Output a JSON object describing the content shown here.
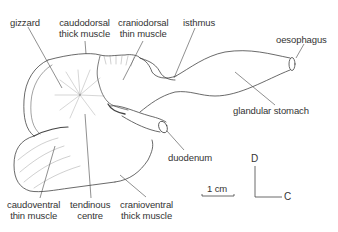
{
  "figure": {
    "labels": {
      "gizzard": {
        "line1": "gizzard"
      },
      "caudodorsal": {
        "line1": "caudodorsal",
        "line2": "thick muscle"
      },
      "craniodorsal": {
        "line1": "craniodorsal",
        "line2": "thin muscle"
      },
      "isthmus": {
        "line1": "isthmus"
      },
      "oesophagus": {
        "line1": "oesophagus"
      },
      "glandular": {
        "line1": "glandular stomach"
      },
      "duodenum": {
        "line1": "duodenum"
      },
      "caudoventral": {
        "line1": "caudoventral",
        "line2": "thin muscle"
      },
      "tendinous": {
        "line1": "tendinous",
        "line2": "centre"
      },
      "cranioventral": {
        "line1": "cranioventral",
        "line2": "thick muscle"
      }
    },
    "scale_bar": {
      "label": "1 cm"
    },
    "orientation": {
      "dorsal": "D",
      "cranial": "C"
    },
    "colors": {
      "line": "#444444",
      "text": "#333333",
      "background": "#ffffff"
    }
  }
}
